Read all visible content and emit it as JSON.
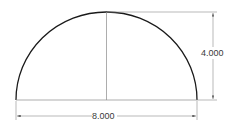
{
  "drawing": {
    "shape": "semicircle",
    "dimensions": {
      "width_label": "8.000",
      "height_label": "4.000"
    },
    "colors": {
      "outline": "#1a1a1a",
      "dimension_line": "#8a8a8a",
      "text": "#3a3a3a",
      "background": "#ffffff"
    }
  }
}
